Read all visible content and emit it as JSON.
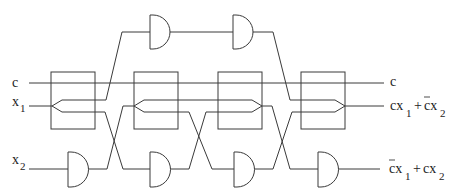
{
  "diagram": {
    "type": "reversible-logic-circuit",
    "inputs": {
      "c": "c",
      "x1": {
        "base": "x",
        "sub": "1"
      },
      "x2": {
        "base": "x",
        "sub": "2"
      }
    },
    "outputs": {
      "c": "c",
      "out1": {
        "t1": "cx",
        "t1_sub": "1",
        "plus": " + ",
        "t2": "cx",
        "t2_bar": "c",
        "t2_sub": "2",
        "text": "cx₁ + c̄x₂"
      },
      "out2": {
        "t1": "cx",
        "t1_bar": "c",
        "t1_sub": "1",
        "plus": " + ",
        "t2": "cx",
        "t2_sub": "2",
        "text": "c̄x₁ + cx₂"
      }
    },
    "components": {
      "switch_boxes": 4,
      "and_gates_top": 2,
      "and_gates_bottom": 4
    },
    "line_color": "#3a3a3a"
  }
}
